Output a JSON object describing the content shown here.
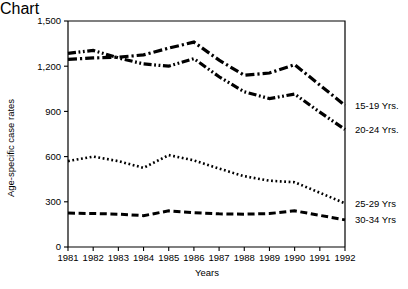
{
  "chart_data": {
    "type": "line",
    "title": "",
    "xlabel": "Years",
    "ylabel": "Age-specific case rates",
    "x": [
      1981,
      1982,
      1983,
      1984,
      1985,
      1986,
      1987,
      1988,
      1989,
      1990,
      1991,
      1992
    ],
    "xticklabels": [
      "1981",
      "1982",
      "1983",
      "1984",
      "1985",
      "1986",
      "1987",
      "1988",
      "1989",
      "1990",
      "1991",
      "1992"
    ],
    "yticks": [
      0,
      300,
      600,
      900,
      1200,
      1500
    ],
    "yticklabels": [
      "0",
      "300",
      "600",
      "900",
      "1,200",
      "1,500"
    ],
    "ylim": [
      0,
      1500
    ],
    "xlim": [
      1981,
      1992
    ],
    "grid": false,
    "legend_position": "right-outside",
    "series": [
      {
        "name": "15-19 Yrs.",
        "label": "15-19 Yrs.",
        "linestyle": "dashdot",
        "color": "#000000",
        "values": [
          1245,
          1255,
          1260,
          1275,
          1320,
          1360,
          1240,
          1140,
          1155,
          1210,
          1075,
          940
        ]
      },
      {
        "name": "20-24 Yrs.",
        "label": "20-24 Yrs.",
        "linestyle": "dashdotdot",
        "color": "#000000",
        "values": [
          1285,
          1305,
          1255,
          1215,
          1200,
          1250,
          1130,
          1030,
          985,
          1015,
          895,
          780
        ]
      },
      {
        "name": "25-29 Yrs",
        "label": "25-29 Yrs",
        "linestyle": "dotted",
        "color": "#000000",
        "values": [
          570,
          600,
          570,
          525,
          610,
          575,
          520,
          470,
          440,
          430,
          360,
          290
        ]
      },
      {
        "name": "30-34 Yrs",
        "label": "30-34 Yrs",
        "linestyle": "dashed",
        "color": "#000000",
        "values": [
          225,
          222,
          218,
          208,
          240,
          228,
          220,
          218,
          222,
          240,
          210,
          180
        ]
      }
    ]
  }
}
